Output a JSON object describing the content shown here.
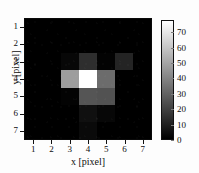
{
  "figure": {
    "type": "heatmap-figure"
  },
  "chart_data": {
    "type": "heatmap",
    "title": "",
    "xlabel": "x [pixel]",
    "ylabel": "y [pixel]",
    "x": [
      1,
      2,
      3,
      4,
      5,
      6,
      7
    ],
    "y": [
      1,
      2,
      3,
      4,
      5,
      6,
      7
    ],
    "xticklabels": [
      "1",
      "2",
      "3",
      "4",
      "5",
      "6",
      "7"
    ],
    "yticklabels": [
      "1",
      "2",
      "3",
      "4",
      "5",
      "6",
      "7"
    ],
    "xlim": [
      0.5,
      7.5
    ],
    "ylim": [
      7.5,
      0.5
    ],
    "y_axis_direction": "inverted",
    "grid": false,
    "colormap": "gray",
    "clim": [
      0,
      78
    ],
    "colorbar": {
      "position": "right",
      "orientation": "vertical",
      "ticks": [
        0,
        10,
        20,
        30,
        40,
        50,
        60,
        70
      ],
      "ticklabels": [
        "0",
        "10",
        "20",
        "30",
        "40",
        "50",
        "60",
        "70"
      ],
      "vmin": 0,
      "vmax": 78
    },
    "values": [
      [
        0,
        0,
        0,
        0,
        0,
        0,
        0
      ],
      [
        0,
        0,
        0,
        0,
        0,
        0,
        0
      ],
      [
        0,
        0,
        2,
        14,
        1,
        11,
        0
      ],
      [
        0,
        0,
        48,
        78,
        33,
        0,
        0
      ],
      [
        0,
        0,
        1,
        26,
        25,
        0,
        0
      ],
      [
        0,
        0,
        0,
        5,
        2,
        0,
        0
      ],
      [
        0,
        0,
        0,
        3,
        0,
        0,
        0
      ]
    ]
  }
}
